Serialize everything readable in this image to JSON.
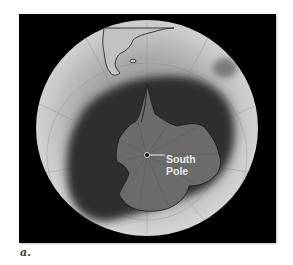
{
  "figure": {
    "label": {
      "line1": "South",
      "line2": "Pole"
    },
    "caption": "a."
  },
  "colors": {
    "background": "#000000",
    "globe_light": "#cfcfcf",
    "globe_mid": "#9a9a9a",
    "ozone_hole": "#3a3a3a",
    "antarctica": "#6e6e6e",
    "coastline": "#1a1a1a",
    "label": "#e8e8e8"
  }
}
